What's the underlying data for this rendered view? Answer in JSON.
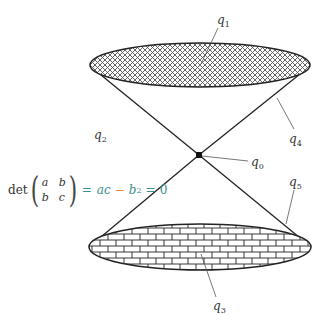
{
  "labels": {
    "q0": {
      "base": "q",
      "sub": "0"
    },
    "q1": {
      "base": "q",
      "sub": "1"
    },
    "q2": {
      "base": "q",
      "sub": "2"
    },
    "q3": {
      "base": "q",
      "sub": "3"
    },
    "q4": {
      "base": "q",
      "sub": "4"
    },
    "q5": {
      "base": "q",
      "sub": "5"
    }
  },
  "equation": {
    "func": "det",
    "matrix": [
      "a",
      "b",
      "b",
      "c"
    ],
    "eq1": "=",
    "term1": "ac",
    "minus": "−",
    "term2": "b",
    "exp": "2",
    "eq2": "=",
    "rhs": "0"
  },
  "colors": {
    "line": "#222222",
    "teal": "#3a8e8e",
    "orange": "#e8833a"
  }
}
